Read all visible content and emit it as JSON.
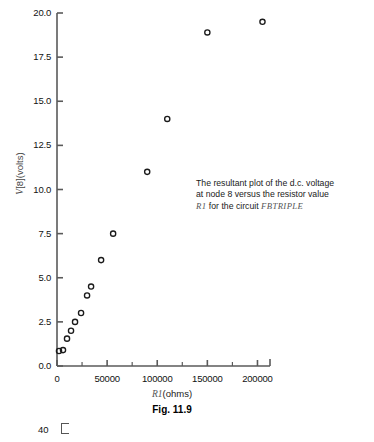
{
  "chart_data": {
    "type": "scatter",
    "title": "",
    "xlabel": "R1(ohms)",
    "ylabel": "V[8](volts)",
    "xlim": [
      0,
      212500
    ],
    "ylim": [
      0.0,
      20.0
    ],
    "grid": false,
    "legend": null,
    "marker": "open-circle",
    "x": [
      2000,
      6000,
      10000,
      14000,
      18000,
      24000,
      30000,
      34000,
      44000,
      56000,
      90000,
      110000,
      150000,
      205000
    ],
    "y": [
      0.85,
      0.9,
      1.55,
      2.0,
      2.5,
      3.0,
      4.0,
      4.5,
      6.0,
      7.5,
      11.0,
      14.0,
      18.9,
      19.5
    ],
    "points": [
      {
        "x": 2000,
        "y": 0.85
      },
      {
        "x": 6000,
        "y": 0.9
      },
      {
        "x": 10000,
        "y": 1.55
      },
      {
        "x": 14000,
        "y": 2.0
      },
      {
        "x": 18000,
        "y": 2.5
      },
      {
        "x": 24000,
        "y": 3.0
      },
      {
        "x": 30000,
        "y": 4.0
      },
      {
        "x": 34000,
        "y": 4.5
      },
      {
        "x": 44000,
        "y": 6.0
      },
      {
        "x": 56000,
        "y": 7.5
      },
      {
        "x": 90000,
        "y": 11.0
      },
      {
        "x": 110000,
        "y": 14.0
      },
      {
        "x": 150000,
        "y": 18.9
      },
      {
        "x": 205000,
        "y": 19.5
      }
    ],
    "yticks": [
      0.0,
      2.5,
      5.0,
      7.5,
      10.0,
      12.5,
      15.0,
      17.5,
      20.0
    ],
    "ytick_labels": [
      "0.0",
      "2.5",
      "5.0",
      "7.5",
      "10.0",
      "12.5",
      "15.0",
      "17.5",
      "20.0"
    ],
    "xticks": [
      0,
      50000,
      100000,
      150000,
      200000
    ],
    "xtick_labels": [
      "0",
      "50000",
      "100000",
      "150000",
      "200000"
    ],
    "xminor_ticks": [
      25000,
      75000,
      125000,
      175000
    ],
    "annotation": {
      "line1": "The resultant plot of the d.c. voltage",
      "line2": "at node 8 versus the resistor value",
      "line3_r1": "R1",
      "line3_mid": " for the circuit ",
      "line3_circuit": "FBTRIPLE"
    },
    "caption": "Fig. 11.9",
    "xlabel_italic": "R1",
    "xlabel_rest": "(ohms)",
    "ylabel_italic": "V",
    "ylabel_rest": "[8](volts)",
    "colors": {
      "axis": "#5a5a5a",
      "marker_stroke": "#1a1a1a",
      "text": "#111111",
      "annotation_accent": "#555555",
      "background": "#ffffff"
    }
  },
  "stray_fragment": {
    "label": "40"
  }
}
